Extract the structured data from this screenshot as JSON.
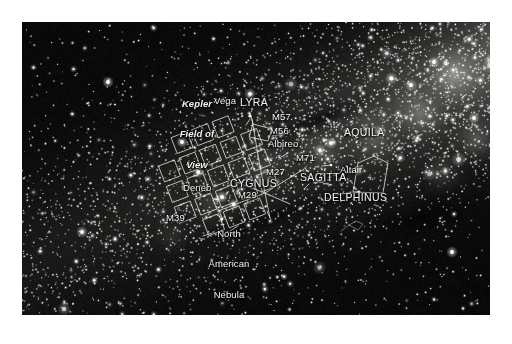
{
  "figure": {
    "name": "kepler-field-of-view-sky-chart",
    "background_color": "#ffffff",
    "sky_color": "#080a0e",
    "label_color": "#f2f2ef",
    "line_color": "#e8e8e4",
    "frame": {
      "x": 22,
      "y": 22,
      "width": 468,
      "height": 293
    }
  },
  "annotations": {
    "kepler_fov": {
      "line1": "Kepler",
      "line2": "Field of",
      "line3": "View"
    },
    "labels": [
      {
        "id": "vega",
        "text": "Vega",
        "x": 214,
        "y": 96,
        "size": "sz-md",
        "style": ""
      },
      {
        "id": "lyra",
        "text": "LYRA",
        "x": 240,
        "y": 97,
        "size": "sz-lg",
        "style": "cap"
      },
      {
        "id": "m57",
        "text": "M57",
        "x": 272,
        "y": 112,
        "size": "sz-md",
        "style": ""
      },
      {
        "id": "m56",
        "text": "M56",
        "x": 270,
        "y": 126,
        "size": "sz-md",
        "style": ""
      },
      {
        "id": "albireo",
        "text": "Albireo",
        "x": 268,
        "y": 139,
        "size": "sz-md",
        "style": ""
      },
      {
        "id": "aquila",
        "text": "AQUILA",
        "x": 344,
        "y": 127,
        "size": "sz-lg",
        "style": "cap"
      },
      {
        "id": "m71",
        "text": "M71",
        "x": 296,
        "y": 153,
        "size": "sz-md",
        "style": ""
      },
      {
        "id": "altair",
        "text": "Altair",
        "x": 340,
        "y": 165,
        "size": "sz-md",
        "style": ""
      },
      {
        "id": "m27",
        "text": "M27",
        "x": 266,
        "y": 167,
        "size": "sz-md",
        "style": ""
      },
      {
        "id": "sagitta",
        "text": "SAGITTA",
        "x": 300,
        "y": 172,
        "size": "sz-lg",
        "style": "cap"
      },
      {
        "id": "cygnus",
        "text": "CYGNUS",
        "x": 230,
        "y": 178,
        "size": "sz-lg",
        "style": "cap"
      },
      {
        "id": "m29",
        "text": "M29",
        "x": 238,
        "y": 190,
        "size": "sz-md",
        "style": ""
      },
      {
        "id": "delphinus",
        "text": "DELPHINUS",
        "x": 324,
        "y": 192,
        "size": "sz-lg",
        "style": "cap"
      },
      {
        "id": "deneb",
        "text": "Deneb",
        "x": 183,
        "y": 183,
        "size": "sz-md",
        "style": ""
      },
      {
        "id": "m39",
        "text": "M39",
        "x": 166,
        "y": 213,
        "size": "sz-md",
        "style": ""
      }
    ],
    "north_american_nebula": {
      "line1": "North",
      "line2": "American",
      "line3": "Nebula"
    }
  }
}
